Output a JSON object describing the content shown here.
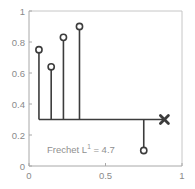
{
  "chart_data": {
    "type": "scatter",
    "title": "",
    "xlabel": "",
    "ylabel": "",
    "xlim": [
      0,
      1
    ],
    "ylim": [
      0,
      1
    ],
    "grid": false,
    "legend": null,
    "xticks": [
      0,
      0.5,
      1
    ],
    "xticklabels": [
      "0",
      "0.5",
      "1"
    ],
    "yticks": [
      0,
      0.2,
      0.4,
      0.6,
      0.8,
      1
    ],
    "yticklabels": [
      "0",
      "0.2",
      "0.4",
      "0.6",
      "0.8",
      "1"
    ],
    "baseline_y": 0.3,
    "baseline_x_start": 0.065,
    "baseline_x_end": 0.885,
    "stems": [
      {
        "x": 0.065,
        "y": 0.75,
        "marker": "circle"
      },
      {
        "x": 0.145,
        "y": 0.64,
        "marker": "circle"
      },
      {
        "x": 0.225,
        "y": 0.83,
        "marker": "circle"
      },
      {
        "x": 0.33,
        "y": 0.9,
        "marker": "circle"
      },
      {
        "x": 0.75,
        "y": 0.1,
        "marker": "circle"
      }
    ],
    "end_marker": {
      "x": 0.885,
      "y": 0.3,
      "marker": "x"
    },
    "annotations": [
      {
        "text_prefix": "Frechet L",
        "superscript": "1",
        "text_suffix": " = 4.7",
        "x": 0.12,
        "y": 0.135
      }
    ],
    "colors": {
      "line": "#3c3c3c",
      "marker_edge": "#3c3c3c",
      "marker_face": "#ffffff",
      "axis": "#b9b9b9",
      "tick_text": "#8a8a8a",
      "annotation_text": "#8f8f8f",
      "background": "#ffffff"
    }
  },
  "annotation": {
    "prefix": "Frechet L",
    "superscript": "1",
    "suffix": " = 4.7"
  },
  "axes": {
    "x_tick_0": "0",
    "x_tick_1": "0.5",
    "x_tick_2": "1",
    "y_tick_0": "0",
    "y_tick_1": "0.2",
    "y_tick_2": "0.4",
    "y_tick_3": "0.6",
    "y_tick_4": "0.8",
    "y_tick_5": "1"
  }
}
